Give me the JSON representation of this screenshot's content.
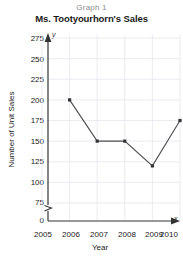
{
  "header": {
    "graph_label": "Graph 1",
    "title": "Ms. Tootyourhorn's Sales"
  },
  "axes": {
    "y_letter": "y",
    "x_letter": "x"
  },
  "chart_data": {
    "type": "line",
    "title": "Ms. Tootyourhorn's Sales",
    "subtitle": "Graph 1",
    "xlabel": "Year",
    "ylabel": "Number of Unit Sales",
    "categories": [
      2006,
      2007,
      2008,
      2009,
      2010
    ],
    "values": [
      200,
      150,
      150,
      120,
      175
    ],
    "series": [
      {
        "name": "Unit Sales",
        "points": [
          {
            "x": 2006,
            "y": 200
          },
          {
            "x": 2007,
            "y": 150
          },
          {
            "x": 2008,
            "y": 150
          },
          {
            "x": 2009,
            "y": 120
          },
          {
            "x": 2010,
            "y": 175
          }
        ]
      }
    ],
    "xticks": [
      "2005",
      "2006",
      "2007",
      "2008",
      "2009",
      "2010"
    ],
    "yticks": [
      "0",
      "75",
      "100",
      "125",
      "150",
      "175",
      "200",
      "225",
      "250",
      "275"
    ],
    "xlim": [
      2005,
      2010
    ],
    "ylim": [
      75,
      275
    ],
    "y_axis_break": true,
    "y_axis_break_between": [
      0,
      75
    ],
    "grid": true,
    "legend": "none",
    "line_color": "#4d4d4d",
    "marker_color": "#333333",
    "grid_color": "#e6e6ef"
  }
}
